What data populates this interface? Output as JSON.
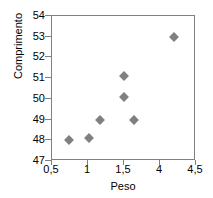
{
  "chart_data": {
    "type": "scatter",
    "title": "",
    "xlabel": "Peso",
    "ylabel": "Comprimento",
    "x_tick_labels": [
      "0,5",
      "1",
      "1,5",
      "4",
      "4,5"
    ],
    "y_tick_labels": [
      "47",
      "48",
      "49",
      "50",
      "51",
      "52",
      "53",
      "54"
    ],
    "ylim": [
      47,
      54
    ],
    "y_step": 1,
    "grid": false,
    "legend": null,
    "marker_color": "#808080",
    "marker_shape": "diamond",
    "axis_color": "#808080",
    "background": "#ffffff",
    "points": [
      {
        "x": "0,8",
        "y": 48.0,
        "px": 17,
        "py": 48.0
      },
      {
        "x": "1,1",
        "y": 48.1,
        "px": 37,
        "py": 48.1
      },
      {
        "x": "1,2",
        "y": 49.0,
        "px": 48,
        "py": 49.0
      },
      {
        "x": "1,5",
        "y": 50.1,
        "px": 72,
        "py": 50.1
      },
      {
        "x": "1,5",
        "y": 51.1,
        "px": 72,
        "py": 51.1
      },
      {
        "x": "1,7",
        "y": 49.0,
        "px": 82,
        "py": 49.0
      },
      {
        "x": "4,2",
        "y": 53.0,
        "px": 122,
        "py": 53.0
      }
    ]
  }
}
